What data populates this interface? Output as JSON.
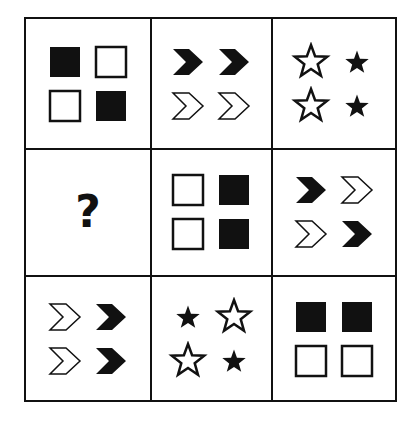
{
  "puzzle": {
    "type": "3x3 matrix reasoning puzzle",
    "grid": [
      [
        {
          "shape": "square",
          "layout": [
            [
              "filled",
              "outline"
            ],
            [
              "outline",
              "filled"
            ]
          ]
        },
        {
          "shape": "chevron",
          "layout": [
            [
              "filled",
              "filled"
            ],
            [
              "outline",
              "outline"
            ]
          ]
        },
        {
          "shape": "star",
          "layout": [
            [
              "outline",
              "filled"
            ],
            [
              "outline",
              "filled"
            ]
          ]
        }
      ],
      [
        {
          "shape": "unknown",
          "label": "?"
        },
        {
          "shape": "square",
          "layout": [
            [
              "outline",
              "filled"
            ],
            [
              "outline",
              "filled"
            ]
          ]
        },
        {
          "shape": "chevron",
          "layout": [
            [
              "filled",
              "outline"
            ],
            [
              "outline",
              "filled"
            ]
          ]
        }
      ],
      [
        {
          "shape": "chevron",
          "layout": [
            [
              "outline",
              "filled"
            ],
            [
              "outline",
              "filled"
            ]
          ]
        },
        {
          "shape": "star",
          "layout": [
            [
              "filled",
              "outline"
            ],
            [
              "outline",
              "filled"
            ]
          ]
        },
        {
          "shape": "square",
          "layout": [
            [
              "filled",
              "filled"
            ],
            [
              "outline",
              "outline"
            ]
          ]
        }
      ]
    ],
    "question_mark": "?",
    "colors": {
      "ink": "#111111",
      "background": "#ffffff"
    }
  }
}
